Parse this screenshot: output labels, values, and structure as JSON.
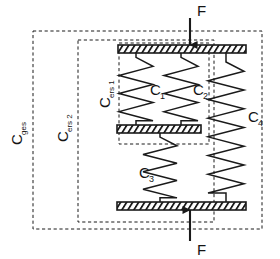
{
  "diagram": {
    "type": "mechanical-spring-schematic",
    "colors": {
      "line": "#1a1a1a",
      "dashed_boundary": "#1a1a1a",
      "plate_fill": "#ffffff",
      "plate_hatch": "#1a1a1a",
      "background": "#ffffff"
    }
  },
  "boundaries": [
    {
      "id": "c-ges",
      "label_main": "C",
      "label_sub": "ges",
      "x": 33,
      "y": 31,
      "width": 229,
      "height": 198
    },
    {
      "id": "c-ers-2",
      "label_main": "C",
      "label_sub": "ers 2",
      "x": 78,
      "y": 40,
      "width": 136,
      "height": 182
    },
    {
      "id": "c-ers-1",
      "label_main": "C",
      "label_sub": "ers 1",
      "x": 119,
      "y": 43,
      "width": 90,
      "height": 101
    }
  ],
  "plates": [
    {
      "id": "top-plate",
      "x": 118,
      "y": 45,
      "width": 128,
      "height": 8
    },
    {
      "id": "middle-plate",
      "x": 117,
      "y": 125,
      "width": 84,
      "height": 8
    },
    {
      "id": "bottom-plate",
      "x": 117,
      "y": 202,
      "width": 129,
      "height": 8
    }
  ],
  "springs": [
    {
      "id": "spring-c1",
      "label_main": "C",
      "label_sub": "1",
      "x": 136,
      "y_top": 53,
      "y_bottom": 125,
      "amplitude": 17,
      "coils": 3.5,
      "label_x": 150,
      "label_y": 95
    },
    {
      "id": "spring-c2",
      "label_main": "C",
      "label_sub": "2",
      "x": 181,
      "y_top": 53,
      "y_bottom": 125,
      "amplitude": 17,
      "coils": 3.5,
      "label_x": 193,
      "label_y": 95
    },
    {
      "id": "spring-c3",
      "label_main": "C",
      "label_sub": "3",
      "x": 160,
      "y_top": 133,
      "y_bottom": 202,
      "amplitude": 17,
      "coils": 3.5,
      "label_x": 139,
      "label_y": 178
    },
    {
      "id": "spring-c4",
      "label_main": "C",
      "label_sub": "4",
      "x": 226,
      "y_top": 53,
      "y_bottom": 202,
      "amplitude": 18,
      "coils": 7,
      "label_x": 248,
      "label_y": 122
    }
  ],
  "forces": [
    {
      "id": "force-top",
      "label": "F",
      "x": 190,
      "y_start": 18,
      "y_end": 45,
      "direction": "down",
      "label_x": 197,
      "label_y": 16
    },
    {
      "id": "force-bottom",
      "label": "F",
      "x": 190,
      "y_start": 241,
      "y_end": 210,
      "direction": "up",
      "label_x": 197,
      "label_y": 255
    }
  ]
}
